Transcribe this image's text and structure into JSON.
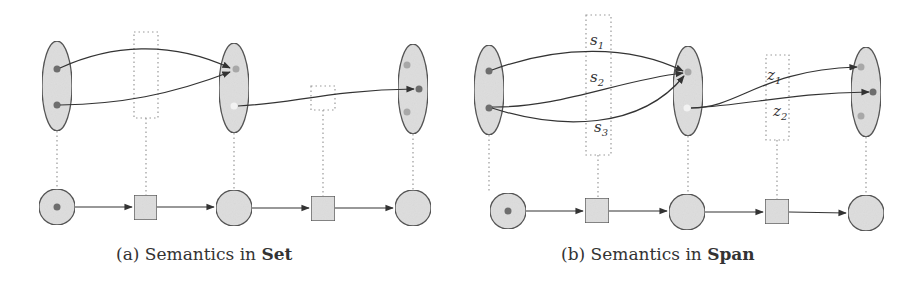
{
  "colors": {
    "node_fill": "#dedede",
    "node_stroke": "#555555",
    "dot_dark": "#6e6e6e",
    "dot_light": "#a8a8a8",
    "dot_white": "#f2f2f2",
    "edge": "#333333",
    "dotted": "#999999"
  },
  "panels": [
    {
      "id": "a",
      "caption_prefix": "(a) Semantics in ",
      "caption_bold": "Set",
      "top_sets": [
        {
          "cx": 57,
          "cy": 86,
          "dots": [
            {
              "y": 69,
              "x": 57,
              "tone": "dark"
            },
            {
              "y": 105,
              "x": 57,
              "tone": "dark"
            }
          ]
        },
        {
          "cx": 234,
          "cy": 88,
          "dots": [
            {
              "y": 69,
              "x": 236,
              "tone": "light"
            },
            {
              "y": 106,
              "x": 234,
              "tone": "white"
            }
          ]
        },
        {
          "cx": 413,
          "cy": 89,
          "dots": [
            {
              "y": 65,
              "x": 407,
              "tone": "light"
            },
            {
              "y": 89,
              "x": 419,
              "tone": "dark"
            },
            {
              "y": 112,
              "x": 407,
              "tone": "light"
            }
          ]
        }
      ],
      "label_boxes": [
        {
          "x": 134,
          "y": 32,
          "w": 24,
          "h": 86,
          "labels": []
        },
        {
          "x": 311,
          "y": 86,
          "w": 24,
          "h": 24,
          "labels": []
        }
      ],
      "bottom_nodes": [
        "circle-marked",
        "square",
        "circle",
        "square",
        "circle"
      ]
    },
    {
      "id": "b",
      "caption_prefix": "(b) Semantics in ",
      "caption_bold": "Span",
      "top_sets": [
        {
          "cx": 489,
          "cy": 90,
          "dots": [
            {
              "y": 71,
              "x": 489,
              "tone": "dark"
            },
            {
              "y": 108,
              "x": 489,
              "tone": "dark"
            }
          ]
        },
        {
          "cx": 688,
          "cy": 91,
          "dots": [
            {
              "y": 72,
              "x": 688,
              "tone": "light"
            },
            {
              "y": 108,
              "x": 687,
              "tone": "white"
            }
          ]
        },
        {
          "cx": 866,
          "cy": 92,
          "dots": [
            {
              "y": 67,
              "x": 861,
              "tone": "light"
            },
            {
              "y": 92,
              "x": 873,
              "tone": "dark"
            },
            {
              "y": 116,
              "x": 861,
              "tone": "light"
            }
          ]
        }
      ],
      "label_boxes": [
        {
          "x": 586,
          "y": 15,
          "w": 25,
          "h": 140,
          "labels": [
            "s1",
            "s2",
            "s3"
          ]
        },
        {
          "x": 766,
          "y": 55,
          "w": 23,
          "h": 85,
          "labels": [
            "z1",
            "z2"
          ]
        }
      ],
      "bottom_nodes": [
        "circle-marked",
        "square",
        "circle",
        "square",
        "circle"
      ]
    }
  ],
  "labels": {
    "s1": {
      "base": "s",
      "sub": "1"
    },
    "s2": {
      "base": "s",
      "sub": "2"
    },
    "s3": {
      "base": "s",
      "sub": "3"
    },
    "z1": {
      "base": "z",
      "sub": "1"
    },
    "z2": {
      "base": "z",
      "sub": "2"
    }
  }
}
